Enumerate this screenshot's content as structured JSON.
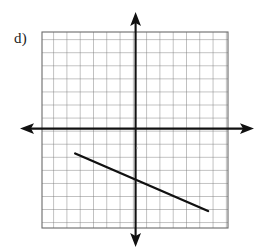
{
  "figure": {
    "part_label": "d)",
    "background_color": "#ffffff",
    "grid_line_color": "#6b6b6b",
    "grid_minor_color": "#8a8a8a",
    "axis_color": "#111111",
    "plot_line_color": "#111111"
  },
  "chart_data": {
    "type": "line",
    "title": "",
    "xlabel": "",
    "ylabel": "",
    "grid": true,
    "grid_spacing": 1,
    "legend": "none",
    "xlim": [
      -7,
      7
    ],
    "ylim": [
      -7.5,
      7.5
    ],
    "xticks": [
      -7,
      -6,
      -5,
      -4,
      -3,
      -2,
      -1,
      0,
      1,
      2,
      3,
      4,
      5,
      6,
      7
    ],
    "yticks": [
      -7,
      -6,
      -5,
      -4,
      -3,
      -2,
      -1,
      0,
      1,
      2,
      3,
      4,
      5,
      6,
      7
    ],
    "xtick_labels": [],
    "ytick_labels": [],
    "axes_arrows": [
      "left",
      "right",
      "up",
      "down"
    ],
    "series": [
      {
        "name": "line-segment",
        "x": [
          -4.5,
          5.5
        ],
        "y": [
          -1.8,
          -6.2
        ],
        "slope": -0.44,
        "y_intercept": -3.8,
        "endpoints": [
          {
            "x": -4.5,
            "y": -1.8
          },
          {
            "x": 5.5,
            "y": -6.2
          }
        ]
      }
    ]
  }
}
